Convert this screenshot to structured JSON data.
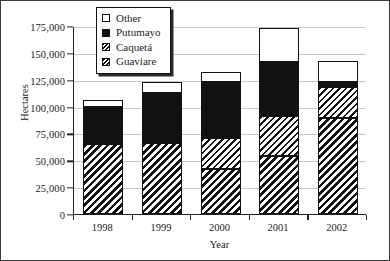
{
  "chart_data": {
    "type": "bar",
    "subtype": "stacked",
    "title": "",
    "xlabel": "Year",
    "ylabel": "Hectares",
    "categories": [
      "1998",
      "1999",
      "2000",
      "2001",
      "2002"
    ],
    "ylim": [
      0,
      175000
    ],
    "ytick_values": [
      0,
      25000,
      50000,
      75000,
      100000,
      125000,
      150000,
      175000
    ],
    "ytick_labels": [
      "0",
      "25,000",
      "50,000",
      "75,000",
      "100,000",
      "125,000",
      "150,000",
      "175,000"
    ],
    "grid": true,
    "legend_position": "top-center",
    "series": [
      {
        "name": "Guaviare",
        "pattern": "dense-diagonal-hatch",
        "values": [
          65500,
          66400,
          42000,
          54300,
          88900
        ]
      },
      {
        "name": "Caquetá",
        "pattern": "diagonal-hatch",
        "values": [
          0,
          0,
          29000,
          36500,
          29100
        ]
      },
      {
        "name": "Putumayo",
        "pattern": "solid-black",
        "values": [
          34500,
          46600,
          51700,
          50600,
          4700
        ]
      },
      {
        "name": "Other",
        "pattern": "white",
        "values": [
          5800,
          9700,
          9300,
          31600,
          19600
        ]
      }
    ],
    "totals": [
      105800,
      122700,
      132000,
      172400,
      142300
    ]
  },
  "legend": {
    "items": [
      {
        "label": "Other",
        "swatch": "white-square-icon"
      },
      {
        "label": "Putumayo",
        "swatch": "black-square-icon"
      },
      {
        "label": "Caquetá",
        "swatch": "hatched-square-icon"
      },
      {
        "label": "Guaviare",
        "swatch": "dense-hatched-square-icon"
      }
    ]
  }
}
